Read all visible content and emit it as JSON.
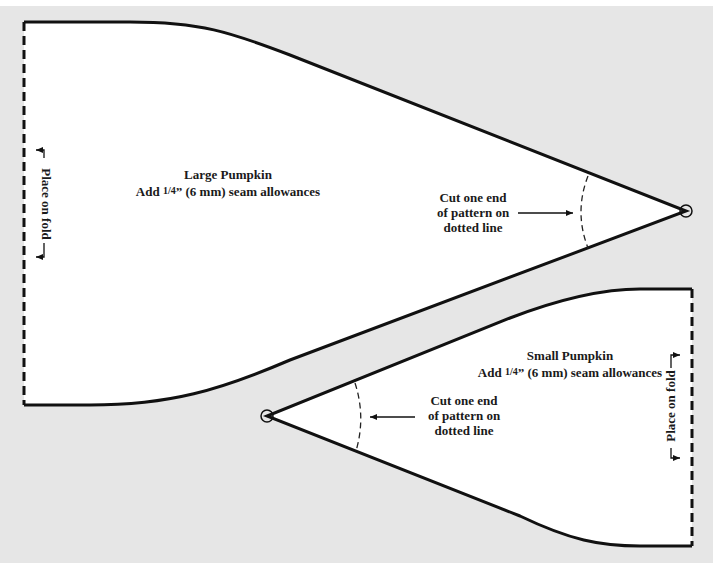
{
  "colors": {
    "background": "#e6e6e6",
    "piece_fill": "#ffffff",
    "outline": "#111111",
    "text": "#1a1a1a"
  },
  "large_piece": {
    "title": "Large Pumpkin",
    "seam_prefix": "Add ",
    "seam_fraction": "1/4",
    "seam_suffix": "” (6 mm) seam allowances",
    "fold_label": "Place on fold",
    "cut_note": {
      "line1": "Cut one end",
      "line2": "of pattern on",
      "line3": "dotted line"
    }
  },
  "small_piece": {
    "title": "Small Pumpkin",
    "seam_prefix": "Add ",
    "seam_fraction": "1/4",
    "seam_suffix": "” (6 mm) seam allowances",
    "fold_label": "Place on fold",
    "cut_note": {
      "line1": "Cut one end",
      "line2": "of pattern on",
      "line3": "dotted line"
    }
  }
}
